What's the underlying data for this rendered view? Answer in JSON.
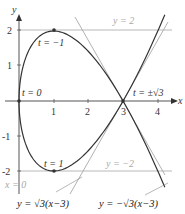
{
  "diagram": {
    "type": "parametric-curve",
    "curve": {
      "x_of_t": "t^2",
      "y_of_t": "t^3 - 3t",
      "t_range": [
        -2.05,
        2.05
      ]
    },
    "axes": {
      "x_label": "x",
      "y_label": "y",
      "x_ticks": [
        "1",
        "2",
        "3",
        "4"
      ],
      "y_ticks": [
        "2",
        "1",
        "-1",
        "-2"
      ]
    },
    "points": [
      {
        "label": "t = 0",
        "x": 0,
        "y": 0
      },
      {
        "label": "t = −1",
        "x": 1,
        "y": 2
      },
      {
        "label": "t = 1",
        "x": 1,
        "y": -2
      },
      {
        "label": "t = ±√3",
        "x": 3,
        "y": 0
      }
    ],
    "tangent_lines": {
      "top": "y = 2",
      "bottom": "y = −2",
      "vertical": "x = 0",
      "positive": "y = √3(x−3)",
      "negative": "y = −√3(x−3)"
    },
    "colors": {
      "curve": "#333333",
      "axis": "#555555",
      "tangent": "#aaaaaa",
      "tangent_label": "#a8a8a8"
    }
  }
}
